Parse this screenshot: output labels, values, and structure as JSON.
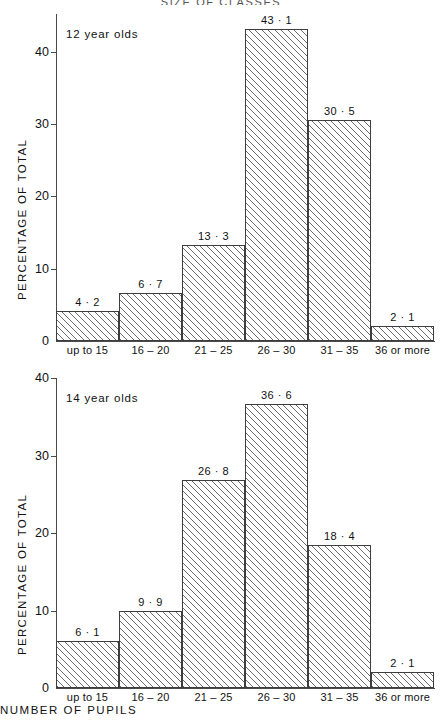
{
  "figure": {
    "title": "SIZE  OF  CLASSES"
  },
  "chart_data": [
    {
      "type": "bar",
      "title": "SIZE OF CLASSES",
      "subtitle": "12 year olds",
      "series_label": "12 year olds",
      "categories": [
        "up to 15",
        "16 – 20",
        "21 – 25",
        "26 – 30",
        "31 – 35",
        "36 or more"
      ],
      "values": [
        4.2,
        6.7,
        13.3,
        43.1,
        30.5,
        2.1
      ],
      "value_labels": [
        "4 · 2",
        "6 · 7",
        "13 · 3",
        "43 · 1",
        "30 · 5",
        "2 · 1"
      ],
      "xlabel": "NUMBER  OF  PUPILS",
      "ylabel": "PERCENTAGE  OF  TOTAL",
      "ylim": [
        0,
        45
      ],
      "yticks": [
        0,
        10,
        20,
        30,
        40
      ],
      "ytick_labels": [
        "0",
        "10",
        "20",
        "30",
        "40"
      ],
      "grid": false,
      "legend": "none",
      "bar_fill": "diagonal-hatch"
    },
    {
      "type": "bar",
      "subtitle": "14 year olds",
      "series_label": "14 year olds",
      "categories": [
        "up to 15",
        "16 – 20",
        "21 – 25",
        "26 – 30",
        "31 – 35",
        "36 or more"
      ],
      "values": [
        6.1,
        9.9,
        26.8,
        36.6,
        18.4,
        2.1
      ],
      "value_labels": [
        "6 · 1",
        "9 · 9",
        "26 · 8",
        "36 · 6",
        "18 · 4",
        "2 · 1"
      ],
      "xlabel": "NUMBER  OF  PUPILS",
      "ylabel": "PERCENTAGE  OF  TOTAL",
      "ylim": [
        0,
        40
      ],
      "yticks": [
        0,
        10,
        20,
        30,
        40
      ],
      "ytick_labels": [
        "0",
        "10",
        "20",
        "30",
        "40"
      ],
      "grid": false,
      "legend": "none",
      "bar_fill": "diagonal-hatch"
    }
  ]
}
